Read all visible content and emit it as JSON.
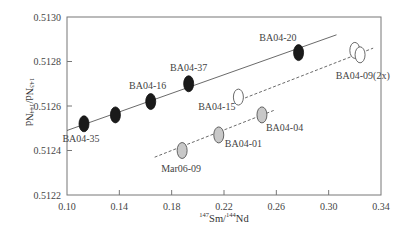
{
  "chart_data": {
    "type": "scatter",
    "title": "",
    "xlabel": "147Sm/144Nd",
    "ylabel": "143Nd/144Nd",
    "xlim": [
      0.1,
      0.34
    ],
    "ylim": [
      0.5122,
      0.513
    ],
    "x_ticks": [
      "0.10",
      "0.14",
      "0.18",
      "0.22",
      "0.26",
      "0.30",
      "0.34"
    ],
    "y_ticks": [
      "0.5122",
      "0.5124",
      "0.5126",
      "0.5128",
      "0.5130"
    ],
    "grid": false,
    "series": [
      {
        "name": "filled-black",
        "marker": "filled ellipse",
        "color": "#1a1a1a",
        "points": [
          {
            "label": "BA04-35",
            "x": 0.113,
            "y": 0.51252
          },
          {
            "label": "",
            "x": 0.137,
            "y": 0.51256
          },
          {
            "label": "BA04-16",
            "x": 0.164,
            "y": 0.51262
          },
          {
            "label": "BA04-37",
            "x": 0.193,
            "y": 0.5127
          },
          {
            "label": "BA04-20",
            "x": 0.277,
            "y": 0.51284
          }
        ],
        "fit_line": {
          "style": "solid",
          "x": [
            0.1,
            0.306
          ],
          "y": [
            0.51249,
            0.51292
          ]
        }
      },
      {
        "name": "open-white",
        "marker": "open ellipse",
        "color": "#ffffff",
        "points": [
          {
            "label": "BA04-15",
            "x": 0.231,
            "y": 0.51264
          },
          {
            "label": "BA04-09(2x)",
            "x": 0.32,
            "y": 0.51285
          },
          {
            "label": "",
            "x": 0.324,
            "y": 0.51283
          }
        ],
        "fit_line": {
          "style": "dashed",
          "x": [
            0.229,
            0.334
          ],
          "y": [
            0.51262,
            0.51286
          ]
        }
      },
      {
        "name": "gray",
        "marker": "gray ellipse",
        "color": "#c8c8c8",
        "points": [
          {
            "label": "Mar06-09",
            "x": 0.188,
            "y": 0.5124
          },
          {
            "label": "BA04-01",
            "x": 0.216,
            "y": 0.51247
          },
          {
            "label": "BA04-04",
            "x": 0.249,
            "y": 0.51256
          }
        ],
        "fit_line": {
          "style": "dashed",
          "x": [
            0.167,
            0.258
          ],
          "y": [
            0.51237,
            0.51258
          ]
        }
      }
    ]
  },
  "axes": {
    "x_title_sup1": "147",
    "x_title_el1": "Sm/",
    "x_title_sup2": "144",
    "x_title_el2": "Nd",
    "y_title_sup1": "143",
    "y_title_el1": "Nd/",
    "y_title_sup2": "144",
    "y_title_el2": "Nd"
  }
}
